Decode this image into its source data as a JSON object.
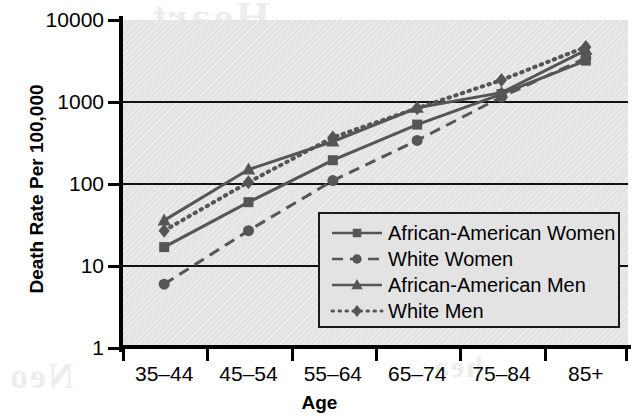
{
  "chart_data": {
    "type": "line",
    "title": "",
    "xlabel": "Age",
    "ylabel": "Death Rate Per 100,000",
    "categories": [
      "35–44",
      "45–54",
      "55–64",
      "65–74",
      "75–84",
      "85+"
    ],
    "yscale": "log",
    "ylim": [
      1,
      10000
    ],
    "ytick_labels": [
      "10000",
      "1000",
      "100",
      "10",
      "1"
    ],
    "ytick_values": [
      10000,
      1000,
      100,
      10,
      1
    ],
    "grid": "horizontal",
    "legend_position": "inside-lower-right",
    "series": [
      {
        "name": "African-American Women",
        "marker": "square",
        "line": "solid",
        "color": "#555555",
        "values": [
          17,
          60,
          195,
          530,
          1250,
          3200
        ]
      },
      {
        "name": "White Women",
        "marker": "circle",
        "line": "dashed",
        "color": "#555555",
        "values": [
          6,
          27,
          110,
          340,
          1150,
          3450
        ]
      },
      {
        "name": "African-American Men",
        "marker": "triangle",
        "line": "solid",
        "color": "#555555",
        "values": [
          36,
          150,
          330,
          850,
          1300,
          4300
        ]
      },
      {
        "name": "White Men",
        "marker": "diamond",
        "line": "dotted",
        "color": "#555555",
        "values": [
          27,
          105,
          370,
          840,
          1850,
          4700
        ]
      }
    ]
  },
  "axes": {
    "y_title": "Death Rate Per 100,000",
    "x_title": "Age"
  },
  "legend": {
    "items": [
      {
        "label": "African-American Women",
        "marker": "square",
        "line": "solid"
      },
      {
        "label": "White Women",
        "marker": "circle",
        "line": "dashed"
      },
      {
        "label": "African-American Men",
        "marker": "triangle",
        "line": "solid"
      },
      {
        "label": "White Men",
        "marker": "diamond",
        "line": "dotted"
      }
    ]
  },
  "ghost_text": {
    "line1": "Heart",
    "line2": "Disease",
    "line3": "Neo",
    "line4": "hea"
  },
  "colors": {
    "plot_background": "#e3e3e3",
    "axis": "#000000",
    "series_ink": "#555555",
    "page_background": "#ffffff"
  }
}
